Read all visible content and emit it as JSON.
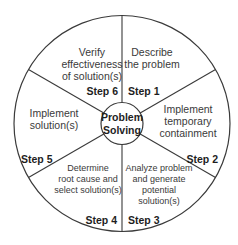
{
  "diagram": {
    "title": "Problem Solving",
    "center": {
      "line1": "Problem",
      "line2": "Solving"
    },
    "colors": {
      "stroke": "#3a3a3a",
      "text": "#3a3a3a",
      "bold_text": "#1e1e1e",
      "background": "#ffffff"
    },
    "segments": [
      {
        "step": "Step 1",
        "lines": [
          "Describe",
          "the problem"
        ]
      },
      {
        "step": "Step 2",
        "lines": [
          "Implement",
          "temporary",
          "containment"
        ]
      },
      {
        "step": "Step 3",
        "lines": [
          "Analyze problem",
          "and generate",
          "potential",
          "solution(s)"
        ]
      },
      {
        "step": "Step 4",
        "lines": [
          "Determine",
          "root cause and",
          "select solution(s)"
        ]
      },
      {
        "step": "Step 5",
        "lines": [
          "Implement",
          "solution(s)"
        ]
      },
      {
        "step": "Step 6",
        "lines": [
          "Verify",
          "effectiveness",
          "of solution(s)"
        ]
      }
    ]
  }
}
